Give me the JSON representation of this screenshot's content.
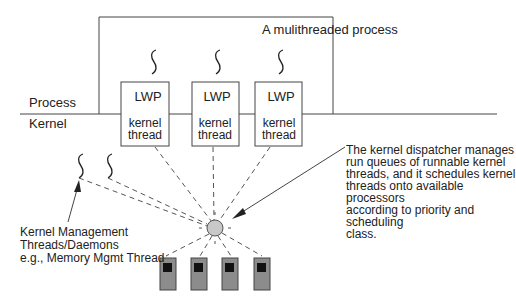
{
  "title": "A mulithreaded process",
  "regions": {
    "process_label": "Process",
    "kernel_label": "Kernel"
  },
  "lwps": [
    {
      "label": "LWP",
      "sublabel_line1": "kernel",
      "sublabel_line2": "thread"
    },
    {
      "label": "LWP",
      "sublabel_line1": "kernel",
      "sublabel_line2": "thread"
    },
    {
      "label": "LWP",
      "sublabel_line1": "kernel",
      "sublabel_line2": "thread"
    }
  ],
  "dispatcher_note": "The kernel dispatcher manages\nrun queues of runnable kernel\nthreads, and it schedules kernel\nthreads onto available processors\naccording to priority and scheduling\nclass.",
  "kernel_threads_note": "Kernel Management\nThreads/Daemons\ne.g., Memory Mgmt Thread",
  "processors": {
    "count": 4
  },
  "colors": {
    "line": "#444444",
    "dispatcher_fill": "#c8c8c8",
    "processor_fill": "#8c8c8c",
    "processor_screen": "#111111"
  }
}
